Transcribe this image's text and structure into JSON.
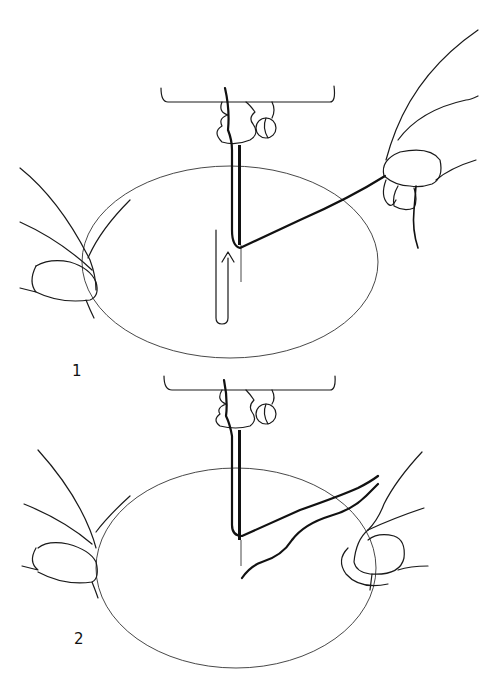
{
  "figure": {
    "type": "line illustration",
    "stroke_color": "#1a1a1a",
    "background": "#ffffff"
  },
  "steps": [
    {
      "label": "1",
      "description": "Thread pulled upward through needle eye; arrow indicates upward direction"
    },
    {
      "label": "2",
      "description": "Thread loop pulled out behind needle across the hoop"
    }
  ]
}
